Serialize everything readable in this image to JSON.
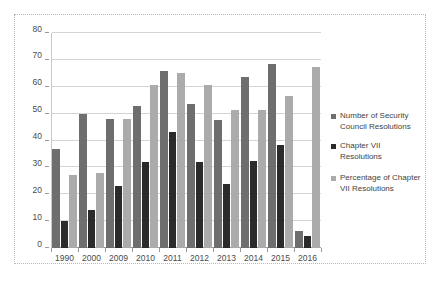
{
  "chart_data": {
    "type": "bar",
    "title": "",
    "subtitle": "",
    "xlabel": "",
    "ylabel": "",
    "ylim": [
      0,
      80
    ],
    "ytick_step": 10,
    "yticks": [
      0,
      10,
      20,
      30,
      40,
      50,
      60,
      70,
      80
    ],
    "grid": true,
    "legend_position": "right",
    "categories": [
      "1990",
      "2000",
      "2009",
      "2010",
      "2011",
      "2012",
      "2013",
      "2014",
      "2015",
      "2016"
    ],
    "series": [
      {
        "name": "Number of Security Council Resolutions",
        "color": "#6e6e6e",
        "values": [
          37,
          50,
          48,
          53,
          66,
          53.5,
          47.5,
          63.5,
          68.5,
          6.5
        ]
      },
      {
        "name": "Chapter VII Resolutions",
        "color": "#2b2b2b",
        "values": [
          10,
          14,
          23,
          32,
          43,
          32,
          24,
          32.5,
          38.5,
          4.5
        ]
      },
      {
        "name": "Percentage of Chapter VII Resolutions",
        "color": "#ababab",
        "values": [
          27,
          28,
          48,
          60.5,
          65,
          60.5,
          51.5,
          51.5,
          56.5,
          67.5
        ]
      }
    ]
  },
  "legend": {
    "items": [
      {
        "label": "Number of Security Council Resolutions",
        "marker": "square-marker",
        "color": "#6e6e6e"
      },
      {
        "label": "Chapter VII Resolutions",
        "marker": "square-marker",
        "color": "#2b2b2b"
      },
      {
        "label": "Percentage of Chapter VII Resolutions",
        "marker": "square-marker",
        "color": "#ababab"
      }
    ]
  }
}
